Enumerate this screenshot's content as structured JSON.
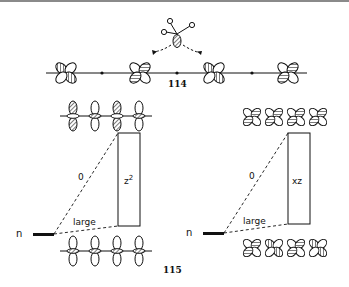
{
  "figure": {
    "top_label": "114",
    "bottom_label": "115",
    "left_panel": {
      "box_label": "z",
      "box_label_sup": "2",
      "upper_line_label": "0",
      "lower_line_label": "large",
      "level_label": "n"
    },
    "right_panel": {
      "box_label": "xz",
      "upper_line_label": "0",
      "lower_line_label": "large",
      "level_label": "n"
    }
  },
  "colors": {
    "ink": "#111111",
    "hatch": "#555555",
    "rule": "#8a8a8a"
  }
}
